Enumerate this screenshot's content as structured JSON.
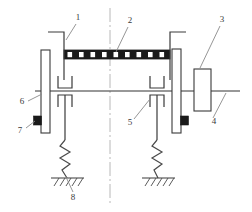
{
  "diagram": {
    "background_color": "#ffffff",
    "line_color": "#333333",
    "fill_black": "#1a1a1a",
    "fill_white": "#ffffff",
    "centerline_color": "#b0b0b0",
    "callouts": [
      {
        "id": "1",
        "label": "1",
        "x": 78,
        "y": 20
      },
      {
        "id": "2",
        "label": "2",
        "x": 130,
        "y": 23
      },
      {
        "id": "3",
        "label": "3",
        "x": 222,
        "y": 22
      },
      {
        "id": "4",
        "label": "4",
        "x": 214,
        "y": 121
      },
      {
        "id": "5",
        "label": "5",
        "x": 130,
        "y": 123
      },
      {
        "id": "6",
        "label": "6",
        "x": 22,
        "y": 104
      },
      {
        "id": "7",
        "label": "7",
        "x": 20,
        "y": 131
      },
      {
        "id": "8",
        "label": "8",
        "x": 73,
        "y": 196
      }
    ],
    "parts": {
      "left_disc": {
        "name": "left-disc",
        "x": 41,
        "y": 50,
        "width": 9,
        "height": 83
      },
      "right_disc": {
        "name": "right-disc",
        "x": 172,
        "y": 49,
        "width": 9,
        "height": 84
      },
      "end_block": {
        "name": "end-block",
        "x": 194,
        "y": 69,
        "width": 17,
        "height": 42
      },
      "segmented_bar": {
        "name": "segmented-bar",
        "x": 64,
        "y": 50,
        "width": 106,
        "height": 9,
        "segments": 17
      },
      "shaft": {
        "name": "main-shaft",
        "y": 91,
        "x1": 35,
        "x2": 240
      },
      "centerline": {
        "name": "vertical-centerline",
        "x": 110,
        "y1": 8,
        "y2": 205
      }
    },
    "supports": {
      "left_spring": {
        "name": "left-spring",
        "x": 67,
        "y_top": 138,
        "y_bottom": 178
      },
      "right_spring": {
        "name": "right-spring",
        "x": 158,
        "y_top": 138,
        "y_bottom": 178
      },
      "left_ground": {
        "name": "left-ground",
        "x": 67,
        "y": 178,
        "width": 32
      },
      "right_ground": {
        "name": "right-ground",
        "x": 158,
        "y": 178,
        "width": 32
      }
    }
  }
}
